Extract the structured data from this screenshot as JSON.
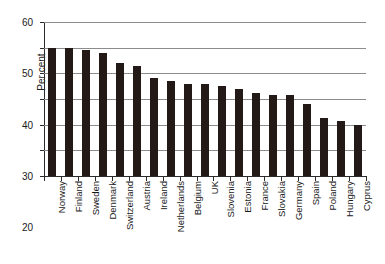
{
  "chart_data": {
    "type": "bar",
    "title": "",
    "subtitle": "",
    "xlabel": "",
    "ylabel": "Per cent",
    "ylim": [
      0,
      60
    ],
    "yticks": [
      0,
      10,
      20,
      30,
      40,
      50,
      60
    ],
    "grid": true,
    "legend": false,
    "bar_color": "#231a17",
    "categories": [
      "Norway",
      "Finland",
      "Sweden",
      "Denmark",
      "Switzerland",
      "Austria",
      "Ireland",
      "Netherlands",
      "Belgium",
      "UK",
      "Slovenia",
      "Estonia",
      "France",
      "Slovakia",
      "Germany",
      "Spain",
      "Poland",
      "Hungary",
      "Cyprus"
    ],
    "values": [
      50,
      50,
      49,
      48,
      44,
      43,
      38,
      37,
      36,
      36,
      35,
      34,
      32.5,
      31.5,
      31.5,
      28,
      22.5,
      21.5,
      20
    ]
  },
  "axes": {
    "y_title": "Per cent"
  }
}
